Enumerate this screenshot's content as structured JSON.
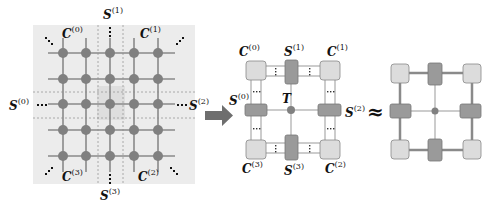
{
  "left_panel": {
    "corner_labels": [
      "C(0)",
      "C(1)",
      "C(2)",
      "C(3)"
    ],
    "edge_labels": [
      "S(0)",
      "S(1)",
      "S(2)",
      "S(3)"
    ],
    "grid_size": "5x5",
    "labels": {
      "c0": {
        "base": "C",
        "sup": "(0)"
      },
      "c1": {
        "base": "C",
        "sup": "(1)"
      },
      "c2": {
        "base": "C",
        "sup": "(2)"
      },
      "c3": {
        "base": "C",
        "sup": "(3)"
      },
      "s0": {
        "base": "S",
        "sup": "(0)"
      },
      "s1": {
        "base": "S",
        "sup": "(1)"
      },
      "s2": {
        "base": "S",
        "sup": "(2)"
      },
      "s3": {
        "base": "S",
        "sup": "(3)"
      }
    }
  },
  "middle_panel": {
    "labels": {
      "c0": {
        "base": "C",
        "sup": "(0)"
      },
      "c1": {
        "base": "C",
        "sup": "(1)"
      },
      "c2": {
        "base": "C",
        "sup": "(2)"
      },
      "c3": {
        "base": "C",
        "sup": "(3)"
      },
      "s0": {
        "base": "S",
        "sup": "(0)"
      },
      "s1": {
        "base": "S",
        "sup": "(1)"
      },
      "s2": {
        "base": "S",
        "sup": "(2)"
      },
      "s3": {
        "base": "S",
        "sup": "(3)"
      },
      "center": "T"
    }
  },
  "approx_symbol": "≈",
  "colors": {
    "node": "#808080",
    "corner_fill": "#dcdcdc",
    "edge_fill": "#9a9a9a",
    "panel_bg": "#ececec",
    "line": "#8a8a8a",
    "arrow": "#6e6e6e"
  }
}
